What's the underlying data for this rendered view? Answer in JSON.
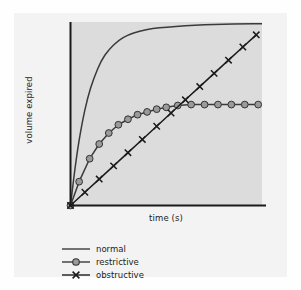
{
  "figure": {
    "background_color": "#f3f3f3",
    "panel_color": "#dcdcdc",
    "axis_color": "#1a1a1a"
  },
  "axes": {
    "xlabel": "time (s)",
    "ylabel": "volume expired"
  },
  "legend": {
    "entries": [
      {
        "label": "normal",
        "marker": "none",
        "color": "#3a3a3a"
      },
      {
        "label": "restrictive",
        "marker": "circle",
        "color": "#3a3a3a",
        "marker_fill": "#9a9a9a"
      },
      {
        "label": "obstructive",
        "marker": "x",
        "color": "#1a1a1a"
      }
    ]
  },
  "chart_data": {
    "type": "line",
    "title": "",
    "xlabel": "time (s)",
    "ylabel": "volume expired",
    "xlim": [
      0,
      10
    ],
    "ylim": [
      0,
      10
    ],
    "grid": false,
    "legend_position": "below-left",
    "axis_ticks": false,
    "series": [
      {
        "name": "normal",
        "marker": "none",
        "color": "#3a3a3a",
        "x": [
          0,
          0.3,
          0.6,
          0.9,
          1.2,
          1.6,
          2.0,
          2.5,
          3.0,
          3.6,
          4.3,
          5.0,
          6.0,
          7.0,
          8.0,
          9.0,
          10.0
        ],
        "y": [
          0,
          2.6,
          4.5,
          5.9,
          6.9,
          7.9,
          8.5,
          9.0,
          9.3,
          9.5,
          9.65,
          9.72,
          9.8,
          9.85,
          9.88,
          9.9,
          9.9
        ]
      },
      {
        "name": "restrictive",
        "marker": "circle",
        "color": "#3a3a3a",
        "marker_fill": "#9a9a9a",
        "x": [
          0,
          0.45,
          1.0,
          1.5,
          2.0,
          2.5,
          3.0,
          3.5,
          4.0,
          4.5,
          5.0,
          5.6,
          6.3,
          7.0,
          7.7,
          8.4,
          9.1,
          9.8
        ],
        "y": [
          0,
          1.3,
          2.55,
          3.35,
          3.95,
          4.4,
          4.7,
          4.95,
          5.1,
          5.25,
          5.35,
          5.45,
          5.5,
          5.5,
          5.5,
          5.5,
          5.5,
          5.5
        ]
      },
      {
        "name": "obstructive",
        "marker": "x",
        "color": "#1a1a1a",
        "x": [
          0,
          0.75,
          1.5,
          2.25,
          3.0,
          3.75,
          4.5,
          5.25,
          6.0,
          6.75,
          7.5,
          8.25,
          9.0,
          9.7
        ],
        "y": [
          0,
          0.72,
          1.44,
          2.16,
          2.88,
          3.6,
          4.32,
          5.04,
          5.76,
          6.48,
          7.2,
          7.92,
          8.64,
          9.3
        ]
      }
    ]
  }
}
